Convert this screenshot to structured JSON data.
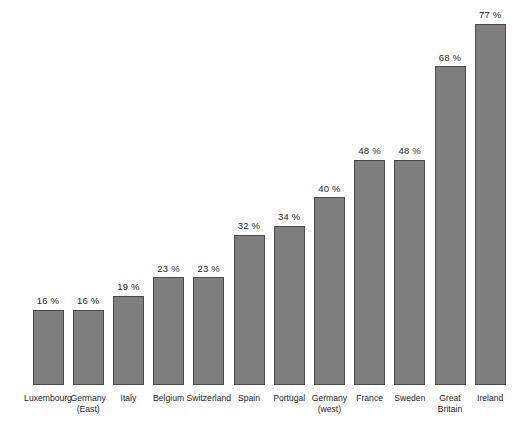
{
  "chart_data": {
    "type": "bar",
    "title": "",
    "subtitle": "",
    "xlabel": "",
    "ylabel": "",
    "ylim": [
      0,
      77
    ],
    "grid": false,
    "legend": false,
    "value_suffix": " %",
    "orientation": "vertical",
    "bar_color": "#807f80",
    "bar_border_color": "#4a4a4a",
    "background_color": "#ffffff",
    "text_color": "#1c1c1c",
    "categories": [
      "Luxembourg",
      "Germany\n(East)",
      "Italy",
      "Belgium",
      "Switzerland",
      "Spain",
      "Portugal",
      "Germany\n(west)",
      "France",
      "Sweden",
      "Great\nBritain",
      "Ireland"
    ],
    "values": [
      16,
      16,
      19,
      23,
      23,
      32,
      34,
      40,
      48,
      48,
      68,
      77
    ],
    "value_labels": [
      "16 %",
      "16 %",
      "19 %",
      "23 %",
      "23 %",
      "32 %",
      "34 %",
      "40 %",
      "48 %",
      "48 %",
      "68 %",
      "77 %"
    ]
  }
}
